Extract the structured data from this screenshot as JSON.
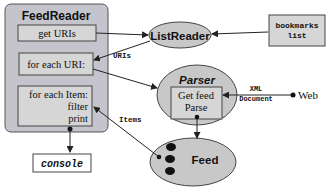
{
  "diagram": {
    "colors": {
      "container_fill": "#c4c4cc",
      "box_fill": "#d6d6d6",
      "ellipse_fill": "#c8c8c8",
      "stroke": "#333333",
      "dot": "#111111"
    },
    "feedreader": {
      "title": "FeedReader",
      "steps": {
        "get_uris": "get URIs",
        "for_each_uri": "for each URI:",
        "for_each_item": "for each Item:",
        "filter": "filter",
        "print": "print"
      }
    },
    "console": {
      "label": "console"
    },
    "listreader": {
      "label": "ListReader"
    },
    "bookmarks": {
      "line1": "bookmarks",
      "line2": "list"
    },
    "parser": {
      "title": "Parser",
      "line1": "Get feed",
      "line2": "Parse"
    },
    "feed": {
      "label": "Feed"
    },
    "web": {
      "label": "Web"
    },
    "edge_labels": {
      "uris": "URIs",
      "items": "Items",
      "xml_line1": "XML",
      "xml_line2": "Document"
    }
  }
}
